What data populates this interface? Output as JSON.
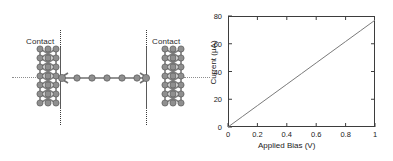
{
  "figure": {
    "panels": [
      "molecular-junction-schematic",
      "current-voltage-plot"
    ]
  },
  "schematic": {
    "left_contact_label": "Contact",
    "right_contact_label": "Contact",
    "atom_color": "#8c8c8c",
    "atom_edge_color": "#555555",
    "bond_color": "#6f6f6f",
    "lattice_color": "#8a8a8a",
    "boundary_line_color": "#3a3a3a",
    "chain_atom_count": 6,
    "lattice_rows": 7,
    "lattice_cols": 3
  },
  "chart_data": {
    "type": "line",
    "title": "",
    "xlabel": "Applied Bias (V)",
    "ylabel": "Current (μA)",
    "xlim": [
      0,
      1
    ],
    "ylim": [
      0,
      80
    ],
    "xticks": [
      0,
      0.2,
      0.4,
      0.6,
      0.8,
      1
    ],
    "xtick_labels": [
      "0",
      "0.2",
      "0.4",
      "0.6",
      "0.8",
      "1"
    ],
    "yticks": [
      0,
      20,
      40,
      60,
      80
    ],
    "ytick_labels": [
      "0",
      "20",
      "40",
      "60",
      "80"
    ],
    "grid": false,
    "legend": false,
    "line_color": "#7a7a7a",
    "series": [
      {
        "name": "I-V",
        "x": [
          0,
          0.1,
          0.2,
          0.3,
          0.4,
          0.5,
          0.6,
          0.7,
          0.8,
          0.9,
          1.0
        ],
        "values": [
          0,
          7.7,
          15.4,
          23.1,
          30.8,
          38.5,
          46.2,
          53.9,
          61.6,
          69.3,
          77.0
        ]
      }
    ]
  }
}
